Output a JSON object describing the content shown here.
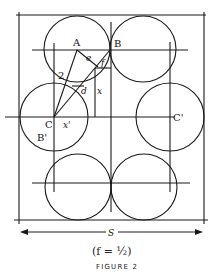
{
  "figure": {
    "labels": {
      "A": "A",
      "B": "B",
      "C": "C",
      "C_prime": "C'",
      "B_prime": "B'",
      "e": "e",
      "f": "f",
      "d": "d",
      "x": "x",
      "x_prime": "x'",
      "two": "2"
    },
    "dimension_label": "S",
    "formula": "(f = ½)",
    "caption": "FIGURE 2"
  }
}
